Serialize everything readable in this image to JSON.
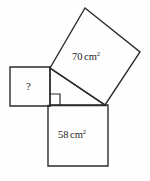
{
  "figure": {
    "kind": "pythagorean-theorem-squares-diagram",
    "background_color": "#fefefe",
    "stroke_color": "#2b2b2b",
    "text_color": "#1d1d1d",
    "width": 150,
    "height": 181,
    "triangle": {
      "vertices": {
        "top_left": [
          50,
          68
        ],
        "right_angle_corner": [
          50,
          106
        ],
        "right": [
          105,
          105
        ]
      },
      "right_angle_at": "right_angle_corner",
      "right_angle_marker_size": 11
    },
    "squares": [
      {
        "name": "hypotenuse-square",
        "label_value": "70",
        "label_unit": "cm",
        "label_exponent": "2",
        "label_full": "70 cm2",
        "orientation": "tilted",
        "points": "50,68 85,8 140,52 105,105",
        "attached_to": "hypotenuse"
      },
      {
        "name": "adjacent-square",
        "label_value": "58",
        "label_unit": "cm",
        "label_exponent": "2",
        "label_full": "58 cm2",
        "orientation": "axis-aligned",
        "points": "48,105 108,105 108,166 48,166",
        "attached_to": "horizontal-leg"
      },
      {
        "name": "unknown-square",
        "label_value": "?",
        "label_unit": "",
        "label_exponent": "",
        "label_full": "?",
        "orientation": "axis-aligned",
        "points": "10,67 50,67 50,106 10,106",
        "attached_to": "vertical-leg"
      }
    ]
  }
}
